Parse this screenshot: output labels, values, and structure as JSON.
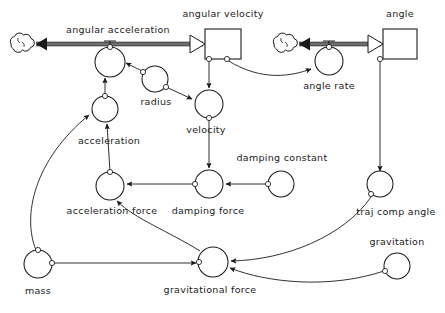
{
  "diagram": {
    "type": "stock-and-flow",
    "background_color": "#ffffff",
    "line_color": "#1a1a1a",
    "pipe_color": "#6e6e6e",
    "width": 445,
    "height": 313,
    "stocks": [
      {
        "id": "angular_velocity",
        "label": "angular velocity",
        "x": 205,
        "y": 44,
        "w": 36,
        "h": 30,
        "label_x": 223,
        "label_y": 13
      },
      {
        "id": "angle",
        "label": "angle",
        "x": 383,
        "y": 44,
        "w": 34,
        "h": 30,
        "label_x": 400,
        "label_y": 13
      }
    ],
    "flows": [
      {
        "id": "angular_acceleration",
        "label": "angular acceleration",
        "label_x": 118,
        "label_y": 30,
        "valve_x": 110,
        "valve_y": 45,
        "from": "cloud_left",
        "to": "angular_velocity"
      },
      {
        "id": "angle_rate",
        "label": "angle rate",
        "label_x": 329,
        "label_y": 85,
        "valve_x": 329,
        "valve_y": 45,
        "from": "cloud_right",
        "to": "angle"
      }
    ],
    "clouds": [
      {
        "id": "cloud_left",
        "x": 18,
        "y": 43
      },
      {
        "id": "cloud_right",
        "x": 281,
        "y": 43
      }
    ],
    "auxiliaries": [
      {
        "id": "angular_acceleration_node",
        "label": "angular acceleration",
        "x": 110,
        "y": 60,
        "r": 15,
        "label_shown": false
      },
      {
        "id": "angle_rate_node",
        "label": "angle rate",
        "x": 329,
        "y": 64,
        "r": 14,
        "label_x": 329,
        "label_y": 85
      },
      {
        "id": "radius",
        "label": "radius",
        "x": 155,
        "y": 78,
        "r": 13,
        "label_x": 155,
        "label_y": 101
      },
      {
        "id": "velocity",
        "label": "velocity",
        "x": 209,
        "y": 105,
        "r": 14,
        "label_x": 206,
        "label_y": 130
      },
      {
        "id": "acceleration",
        "label": "acceleration",
        "x": 105,
        "y": 108,
        "r": 13,
        "label_x": 108,
        "label_y": 140
      },
      {
        "id": "acceleration_force",
        "label": "acceleration force",
        "x": 110,
        "y": 186,
        "r": 14,
        "label_x": 112,
        "label_y": 210
      },
      {
        "id": "damping_force",
        "label": "damping force",
        "x": 209,
        "y": 184,
        "r": 14,
        "label_x": 208,
        "label_y": 210
      },
      {
        "id": "damping_constant",
        "label": "damping constant",
        "x": 281,
        "y": 184,
        "r": 13,
        "label_x": 281,
        "label_y": 158
      },
      {
        "id": "traj_comp_angle",
        "label": "traj comp angle",
        "x": 380,
        "y": 186,
        "r": 13,
        "label_x": 395,
        "label_y": 211
      },
      {
        "id": "mass",
        "label": "mass",
        "x": 38,
        "y": 264,
        "r": 14,
        "label_x": 38,
        "label_y": 290
      },
      {
        "id": "gravitational_force",
        "label": "gravitational force",
        "x": 213,
        "y": 262,
        "r": 15,
        "label_x": 210,
        "label_y": 289
      },
      {
        "id": "gravitation",
        "label": "gravitation",
        "x": 397,
        "y": 266,
        "r": 13,
        "label_x": 397,
        "label_y": 241
      }
    ],
    "labels": {
      "angular_acceleration": "angular acceleration",
      "angular_velocity": "angular velocity",
      "angle": "angle",
      "angle_rate": "angle rate",
      "radius": "radius",
      "velocity": "velocity",
      "acceleration": "acceleration",
      "acceleration_force": "acceleration force",
      "damping_force": "damping force",
      "damping_constant": "damping constant",
      "traj_comp_angle": "traj comp angle",
      "mass": "mass",
      "gravitational_force": "gravitational force",
      "gravitation": "gravitation"
    },
    "connections": [
      {
        "from": "angular_velocity",
        "to": "velocity"
      },
      {
        "from": "angular_velocity",
        "to": "angle_rate_node"
      },
      {
        "from": "radius",
        "to": "angular_acceleration_node"
      },
      {
        "from": "radius",
        "to": "velocity"
      },
      {
        "from": "acceleration",
        "to": "angular_acceleration_node"
      },
      {
        "from": "acceleration_force",
        "to": "acceleration"
      },
      {
        "from": "damping_force",
        "to": "acceleration_force"
      },
      {
        "from": "velocity",
        "to": "damping_force"
      },
      {
        "from": "damping_constant",
        "to": "damping_force"
      },
      {
        "from": "gravitational_force",
        "to": "acceleration_force"
      },
      {
        "from": "mass",
        "to": "gravitational_force"
      },
      {
        "from": "mass",
        "to": "acceleration"
      },
      {
        "from": "gravitation",
        "to": "gravitational_force"
      },
      {
        "from": "traj_comp_angle",
        "to": "gravitational_force"
      },
      {
        "from": "angle",
        "to": "traj_comp_angle"
      }
    ]
  }
}
